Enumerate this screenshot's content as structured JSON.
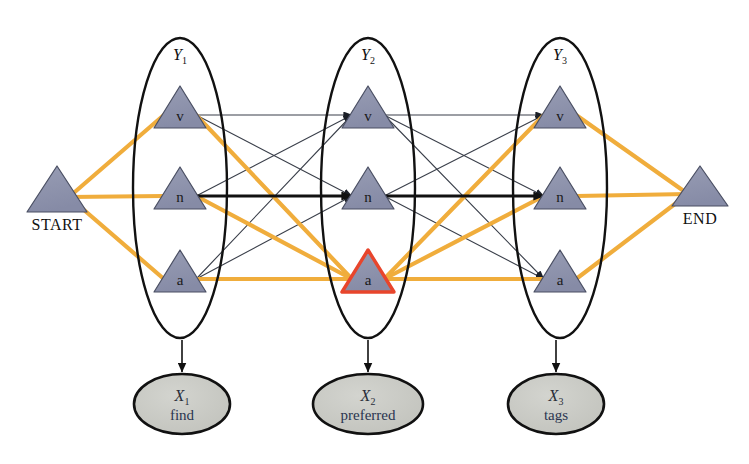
{
  "figure": {
    "background": "#ffffff"
  },
  "colors": {
    "node_fill": "#8f94ad",
    "node_stroke": "#4a4f63",
    "highlight_stroke": "#e8452c",
    "path_edge": "#f0ad3c",
    "normal_edge": "#3a3f4a",
    "bold_edge": "#111111",
    "observed_fill": "#c9cac4",
    "observed_stroke": "#111111",
    "plate_stroke": "#111111"
  },
  "terminals": [
    {
      "id": "start",
      "label": "START",
      "cx": 57,
      "apex_y": 166,
      "base_y": 212,
      "half_w": 30
    },
    {
      "id": "end",
      "label": "END",
      "cx": 700,
      "apex_y": 166,
      "base_y": 206,
      "half_w": 28
    }
  ],
  "plates": [
    {
      "id": "Y1",
      "label": "Y",
      "sub": "1",
      "cx": 180,
      "cy": 188,
      "rx": 47,
      "ry": 150,
      "label_x": 180,
      "label_y": 60
    },
    {
      "id": "Y2",
      "label": "Y",
      "sub": "2",
      "cx": 368,
      "cy": 188,
      "rx": 47,
      "ry": 150,
      "label_x": 368,
      "label_y": 60
    },
    {
      "id": "Y3",
      "label": "Y",
      "sub": "3",
      "cx": 560,
      "cy": 188,
      "rx": 47,
      "ry": 150,
      "label_x": 560,
      "label_y": 60
    }
  ],
  "states": [
    {
      "id": "v1",
      "label": "v",
      "col": 1,
      "cx": 180,
      "cy": 107,
      "highlight": false
    },
    {
      "id": "n1",
      "label": "n",
      "col": 1,
      "cx": 180,
      "cy": 188,
      "highlight": false
    },
    {
      "id": "a1",
      "label": "a",
      "col": 1,
      "cx": 180,
      "cy": 271,
      "highlight": false
    },
    {
      "id": "v2",
      "label": "v",
      "col": 2,
      "cx": 368,
      "cy": 107,
      "highlight": false
    },
    {
      "id": "n2",
      "label": "n",
      "col": 2,
      "cx": 368,
      "cy": 188,
      "highlight": false
    },
    {
      "id": "a2",
      "label": "a",
      "col": 2,
      "cx": 368,
      "cy": 271,
      "highlight": true
    },
    {
      "id": "v3",
      "label": "v",
      "col": 3,
      "cx": 560,
      "cy": 107,
      "highlight": false
    },
    {
      "id": "n3",
      "label": "n",
      "col": 3,
      "cx": 560,
      "cy": 188,
      "highlight": false
    },
    {
      "id": "a3",
      "label": "a",
      "col": 3,
      "cx": 560,
      "cy": 271,
      "highlight": false
    }
  ],
  "observations": [
    {
      "id": "X1",
      "var": "X",
      "sub": "1",
      "word": "find",
      "cx": 182,
      "cy": 404,
      "rx": 48,
      "ry": 30
    },
    {
      "id": "X2",
      "var": "X",
      "sub": "2",
      "word": "preferred",
      "cx": 368,
      "cy": 404,
      "rx": 55,
      "ry": 30
    },
    {
      "id": "X3",
      "var": "X",
      "sub": "3",
      "word": "tags",
      "cx": 556,
      "cy": 404,
      "rx": 48,
      "ry": 30
    }
  ],
  "emission_arrows": [
    {
      "id": "Y1-X1",
      "x": 182,
      "y1": 340,
      "y2": 372
    },
    {
      "id": "Y2-X2",
      "x": 368,
      "y1": 340,
      "y2": 372
    },
    {
      "id": "Y3-X3",
      "x": 556,
      "y1": 340,
      "y2": 372
    }
  ],
  "edges": {
    "transition": [
      {
        "from": "v1",
        "to": "v2",
        "style": "normal"
      },
      {
        "from": "v1",
        "to": "n2",
        "style": "normal"
      },
      {
        "from": "v1",
        "to": "a2",
        "style": "path"
      },
      {
        "from": "n1",
        "to": "v2",
        "style": "normal"
      },
      {
        "from": "n1",
        "to": "n2",
        "style": "bold"
      },
      {
        "from": "n1",
        "to": "a2",
        "style": "path"
      },
      {
        "from": "a1",
        "to": "v2",
        "style": "normal"
      },
      {
        "from": "a1",
        "to": "n2",
        "style": "normal"
      },
      {
        "from": "a1",
        "to": "a2",
        "style": "path"
      },
      {
        "from": "v2",
        "to": "v3",
        "style": "normal"
      },
      {
        "from": "v2",
        "to": "n3",
        "style": "normal"
      },
      {
        "from": "v2",
        "to": "a3",
        "style": "normal"
      },
      {
        "from": "n2",
        "to": "v3",
        "style": "normal"
      },
      {
        "from": "n2",
        "to": "n3",
        "style": "bold"
      },
      {
        "from": "n2",
        "to": "a3",
        "style": "normal"
      },
      {
        "from": "a2",
        "to": "v3",
        "style": "path"
      },
      {
        "from": "a2",
        "to": "n3",
        "style": "path"
      },
      {
        "from": "a2",
        "to": "a3",
        "style": "path"
      }
    ],
    "start": [
      {
        "from": "start",
        "to": "v1",
        "style": "path"
      },
      {
        "from": "start",
        "to": "n1",
        "style": "path"
      },
      {
        "from": "start",
        "to": "a1",
        "style": "path"
      }
    ],
    "end": [
      {
        "from": "v3",
        "to": "end",
        "style": "path"
      },
      {
        "from": "n3",
        "to": "end",
        "style": "path"
      },
      {
        "from": "a3",
        "to": "end",
        "style": "path"
      }
    ]
  },
  "geometry": {
    "state_half_w": 26,
    "state_half_h": 21
  }
}
